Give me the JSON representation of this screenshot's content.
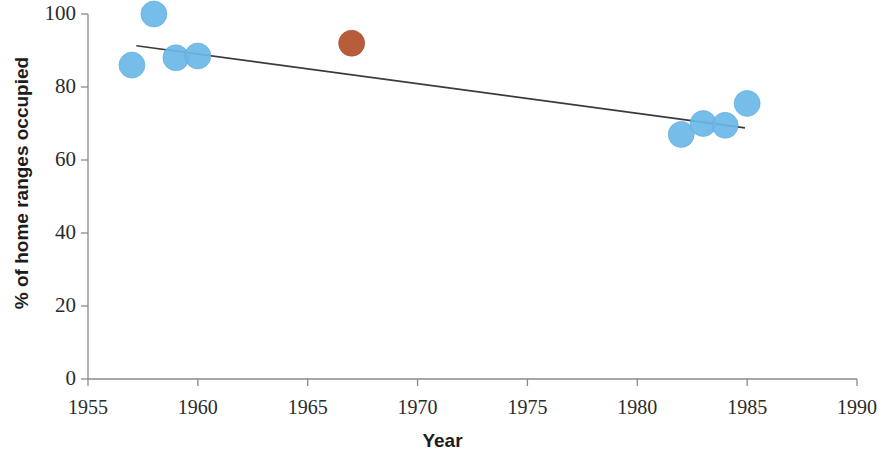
{
  "chart_data": {
    "type": "scatter",
    "title": "",
    "xlabel": "Year",
    "ylabel": "% of home ranges occupied",
    "xlim": [
      1955,
      1990
    ],
    "ylim": [
      0,
      100
    ],
    "xticks": [
      1955,
      1960,
      1965,
      1970,
      1975,
      1980,
      1985,
      1990
    ],
    "yticks": [
      0,
      20,
      40,
      60,
      80,
      100
    ],
    "grid": false,
    "legend": "none",
    "series": [
      {
        "name": "blue-points",
        "color": "#6ab7e8",
        "points": [
          {
            "x": 1957,
            "y": 86
          },
          {
            "x": 1958,
            "y": 100
          },
          {
            "x": 1959,
            "y": 88
          },
          {
            "x": 1960,
            "y": 88.5
          },
          {
            "x": 1982,
            "y": 67
          },
          {
            "x": 1983,
            "y": 70
          },
          {
            "x": 1984,
            "y": 69.5
          },
          {
            "x": 1985,
            "y": 75.5
          }
        ]
      },
      {
        "name": "orange-point",
        "color": "#b4542f",
        "points": [
          {
            "x": 1967,
            "y": 92
          }
        ]
      }
    ],
    "trendline": {
      "name": "linear-trend",
      "color": "#3a3a3a",
      "x_start": 1957.2,
      "y_start": 91.3,
      "x_end": 1984.9,
      "y_end": 68.8
    },
    "marker_radius_px": 13
  },
  "axis": {
    "x_title": "Year",
    "y_title": "% of home ranges occupied",
    "x_tick_labels": [
      "1955",
      "1960",
      "1965",
      "1970",
      "1975",
      "1980",
      "1985",
      "1990"
    ],
    "y_tick_labels": [
      "0",
      "20",
      "40",
      "60",
      "80",
      "100"
    ]
  },
  "colors": {
    "blue": "#6ab7e8",
    "orange": "#b4542f",
    "axis": "#8a8a8a",
    "trend": "#3a3a3a",
    "text": "#2b2b2b"
  }
}
